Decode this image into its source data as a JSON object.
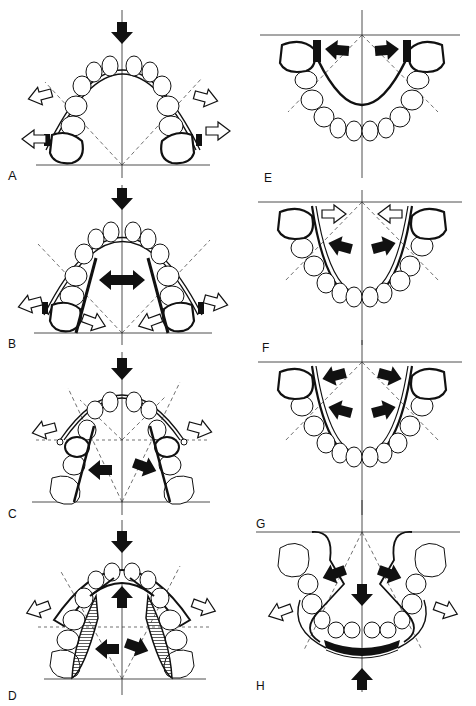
{
  "figure": {
    "panels": [
      {
        "id": "A",
        "label": "A",
        "arch": "upper",
        "appliance": "labial arch with molar bands",
        "arrows": {
          "solid": [
            "down-center"
          ],
          "hollow": [
            "out-left-upper",
            "out-left-lower",
            "out-right-upper",
            "out-right-lower"
          ]
        }
      },
      {
        "id": "B",
        "label": "B",
        "arch": "upper",
        "appliance": "labial arch with lingual arms",
        "arrows": {
          "solid": [
            "down-center",
            "left-center",
            "right-center"
          ],
          "hollow": [
            "out-left",
            "out-right",
            "in-left-bottom",
            "in-right-bottom"
          ]
        }
      },
      {
        "id": "C",
        "label": "C",
        "arch": "upper",
        "appliance": "labial arch with lingual springs",
        "arrows": {
          "solid": [
            "down-center",
            "left-center",
            "right-center"
          ],
          "hollow": [
            "out-left",
            "out-right"
          ]
        }
      },
      {
        "id": "D",
        "label": "D",
        "arch": "upper",
        "appliance": "plate with acrylic wings",
        "arrows": {
          "solid": [
            "down-center",
            "up-center",
            "left-center",
            "right-center"
          ],
          "hollow": [
            "out-left",
            "out-right"
          ]
        }
      },
      {
        "id": "E",
        "label": "E",
        "arch": "lower",
        "appliance": "lingual arch with molar bands",
        "arrows": {
          "solid": [
            "left-top",
            "right-top"
          ],
          "hollow": []
        }
      },
      {
        "id": "F",
        "label": "F",
        "arch": "lower",
        "appliance": "lingual arch",
        "arrows": {
          "solid": [
            "left-top",
            "right-top",
            "left-center",
            "right-center"
          ],
          "hollow": [
            "in-left-top",
            "in-right-top"
          ]
        }
      },
      {
        "id": "G",
        "label": "G",
        "arch": "lower",
        "appliance": "lingual arch",
        "arrows": {
          "solid": [
            "left-top",
            "right-top",
            "left-center",
            "right-center"
          ],
          "hollow": []
        }
      },
      {
        "id": "H",
        "label": "H",
        "arch": "lower",
        "appliance": "lip bumper with lingual shields",
        "arrows": {
          "solid": [
            "left-diag",
            "right-diag",
            "down-center",
            "up-bottom"
          ],
          "hollow": [
            "out-left",
            "out-right"
          ]
        }
      }
    ]
  },
  "colors": {
    "ink": "#111111",
    "background": "#ffffff",
    "hatch": "#333333"
  }
}
